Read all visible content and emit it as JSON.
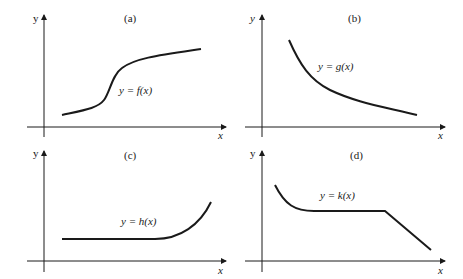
{
  "panels": [
    {
      "id": "a",
      "tag": "(a)",
      "label": "y = f(x)",
      "x_axis": "x",
      "y_axis": "y",
      "shape": "sigmoid increasing"
    },
    {
      "id": "b",
      "tag": "(b)",
      "label": "y = g(x)",
      "x_axis": "x",
      "y_axis": "y",
      "shape": "decreasing convex"
    },
    {
      "id": "c",
      "tag": "(c)",
      "label": "y = h(x)",
      "x_axis": "x",
      "y_axis": "y",
      "shape": "constant then increasing"
    },
    {
      "id": "d",
      "tag": "(d)",
      "label": "y = k(x)",
      "x_axis": "x",
      "y_axis": "y",
      "shape": "decreasing curve, constant, linear decrease"
    }
  ],
  "colors": {
    "ink": "#1a1a1a",
    "background": "#ffffff"
  }
}
